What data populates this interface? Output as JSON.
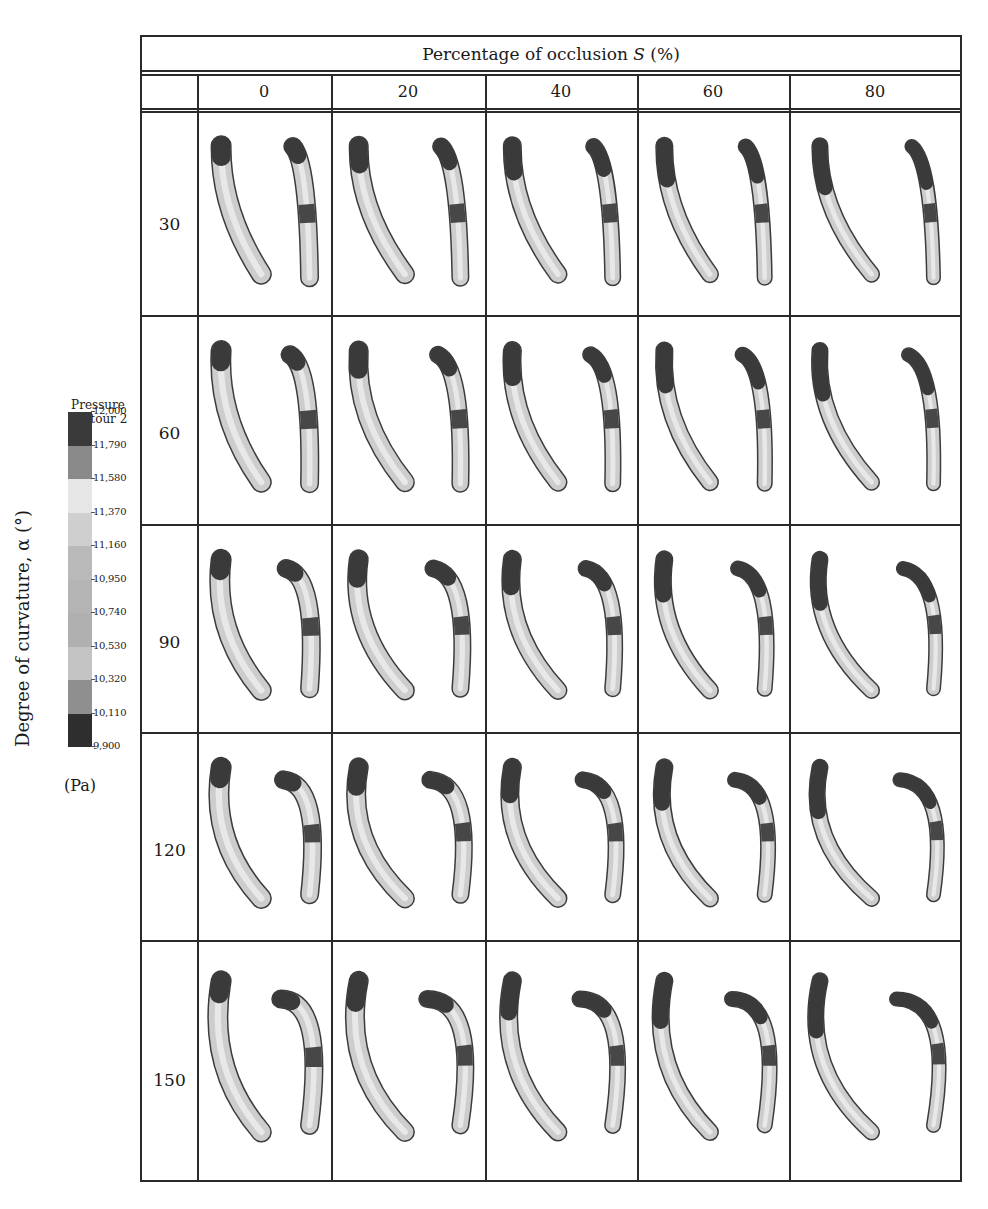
{
  "figure": {
    "header_title": "Percentage of occlusion S (%)",
    "header_title_plain": "Percentage of occlusion ",
    "header_title_var": "S",
    "header_title_unit": " (%)",
    "y_axis_label": "Degree of curvature, α (°)",
    "columns": [
      "0",
      "20",
      "40",
      "60",
      "80"
    ],
    "rows": [
      "30",
      "60",
      "90",
      "120",
      "150"
    ]
  },
  "legend": {
    "title_line1": "Pressure",
    "title_line2": "contour 2",
    "unit": "(Pa)",
    "ticks": [
      "12,000",
      "11,790",
      "11,580",
      "11,370",
      "11,160",
      "10,950",
      "10,740",
      "10,530",
      "10,320",
      "10,110",
      "9,900"
    ],
    "band_colors": [
      "#3a3a3a",
      "#8a8a8a",
      "#e6e6e6",
      "#cfcfcf",
      "#b9b9b9",
      "#b4b4b4",
      "#b0b0b0",
      "#c4c4c4",
      "#8f8f8f",
      "#2e2e2e"
    ]
  },
  "chart_data": {
    "type": "table",
    "xlabel": "Percentage of occlusion S (%)",
    "ylabel": "Degree of curvature, α (°)",
    "categories": [
      "0",
      "20",
      "40",
      "60",
      "80"
    ],
    "row_categories": [
      "30",
      "60",
      "90",
      "120",
      "150"
    ],
    "colorbar": {
      "label": "Pressure contour 2 (Pa)",
      "min": 9900,
      "max": 12000,
      "ticks": [
        12000,
        11790,
        11580,
        11370,
        11160,
        10950,
        10740,
        10530,
        10320,
        10110,
        9900
      ]
    },
    "cells": "Each cell shows two grayscale 3D vessel renderings (front and side view) colored by pressure contour"
  }
}
